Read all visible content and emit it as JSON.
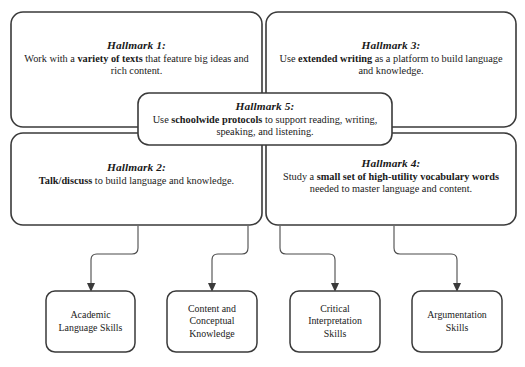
{
  "diagram": {
    "colors": {
      "box_stroke": "#3a3a3a",
      "connector_stroke": "#4a4a4a",
      "box_fill": "#ffffff",
      "text": "#1a1a1a"
    },
    "hallmarks": [
      {
        "id": "hallmark-1",
        "title": "Hallmark 1:",
        "body_prefix": "Work with a ",
        "body_bold": "variety of texts",
        "body_suffix": " that feature big ideas and rich content."
      },
      {
        "id": "hallmark-3",
        "title": "Hallmark 3:",
        "body_prefix": "Use ",
        "body_bold": "extended writing",
        "body_suffix": " as a platform to build language and knowledge."
      },
      {
        "id": "hallmark-5",
        "title": "Hallmark 5:",
        "body_prefix": "Use ",
        "body_bold": "schoolwide protocols",
        "body_suffix": " to support reading, writing, speaking, and listening."
      },
      {
        "id": "hallmark-2",
        "title": "Hallmark 2:",
        "body_prefix": "",
        "body_bold": "Talk/discuss",
        "body_suffix": " to build language and knowledge."
      },
      {
        "id": "hallmark-4",
        "title": "Hallmark 4:",
        "body_prefix": "Study a ",
        "body_bold": "small set of high-utility vocabulary words",
        "body_suffix": " needed to master language and content."
      }
    ],
    "outcomes": [
      {
        "id": "outcome-academic-language-skills",
        "lines": [
          "Academic",
          "Language Skills"
        ]
      },
      {
        "id": "outcome-content-conceptual-knowledge",
        "lines": [
          "Content and",
          "Conceptual",
          "Knowledge"
        ]
      },
      {
        "id": "outcome-critical-interpretation-skills",
        "lines": [
          "Critical",
          "Interpretation",
          "Skills"
        ]
      },
      {
        "id": "outcome-argumentation-skills",
        "lines": [
          "Argumentation",
          "Skills"
        ]
      }
    ]
  }
}
